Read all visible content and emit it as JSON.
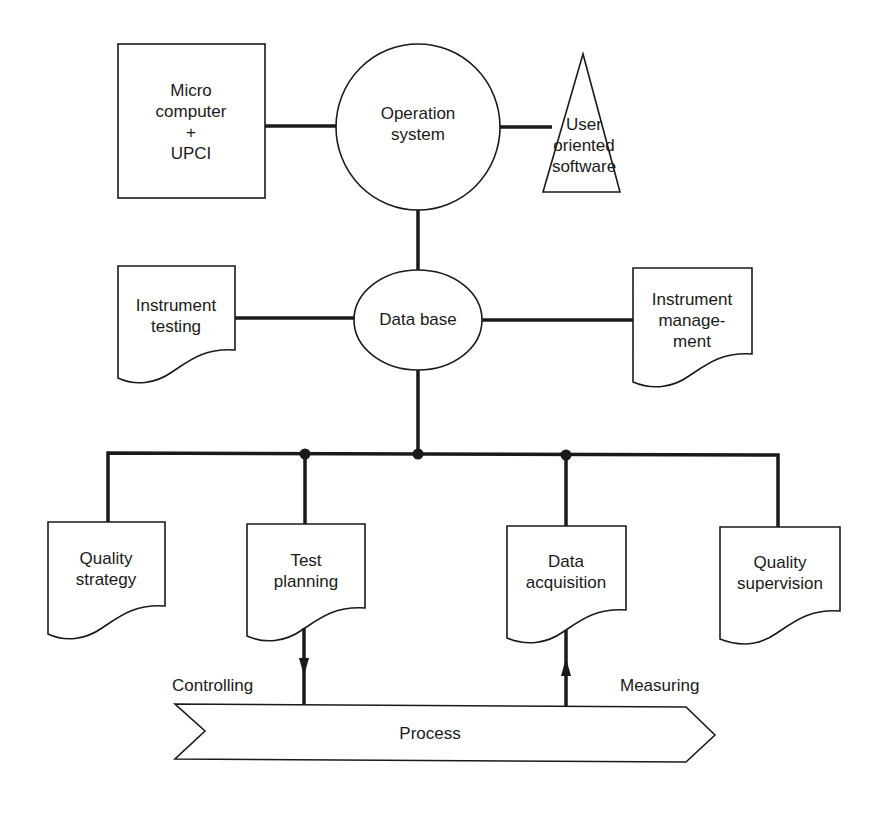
{
  "diagram": {
    "type": "block-diagram",
    "stroke_color": "#1a1a1a",
    "background": "#ffffff",
    "nodes": {
      "micro_computer": {
        "shape": "rectangle",
        "lines": [
          "Micro",
          "computer",
          "+",
          "UPCI"
        ]
      },
      "operation_system": {
        "shape": "circle",
        "lines": [
          "Operation",
          "system"
        ]
      },
      "user_software": {
        "shape": "triangle",
        "lines": [
          "User",
          "oriented",
          "software"
        ]
      },
      "instrument_testing": {
        "shape": "document",
        "lines": [
          "Instrument",
          "testing"
        ]
      },
      "data_base": {
        "shape": "ellipse",
        "lines": [
          "Data base"
        ]
      },
      "instrument_management": {
        "shape": "document",
        "lines": [
          "Instrument",
          "manage-",
          "ment"
        ]
      },
      "quality_strategy": {
        "shape": "document",
        "lines": [
          "Quality",
          "strategy"
        ]
      },
      "test_planning": {
        "shape": "document",
        "lines": [
          "Test",
          "planning"
        ]
      },
      "data_acquisition": {
        "shape": "document",
        "lines": [
          "Data",
          "acquisition"
        ]
      },
      "quality_supervision": {
        "shape": "document",
        "lines": [
          "Quality",
          "supervision"
        ]
      },
      "process": {
        "shape": "chevron-arrow",
        "lines": [
          "Process"
        ]
      }
    },
    "edge_labels": {
      "controlling": "Controlling",
      "measuring": "Measuring"
    },
    "edges": [
      {
        "from": "micro_computer",
        "to": "operation_system",
        "type": "line"
      },
      {
        "from": "operation_system",
        "to": "user_software",
        "type": "line"
      },
      {
        "from": "operation_system",
        "to": "data_base",
        "type": "line"
      },
      {
        "from": "instrument_testing",
        "to": "data_base",
        "type": "line"
      },
      {
        "from": "data_base",
        "to": "instrument_management",
        "type": "line"
      },
      {
        "from": "data_base",
        "to": "bus",
        "type": "line"
      },
      {
        "from": "bus",
        "to": "quality_strategy",
        "type": "line"
      },
      {
        "from": "bus",
        "to": "test_planning",
        "type": "line"
      },
      {
        "from": "bus",
        "to": "data_acquisition",
        "type": "line"
      },
      {
        "from": "bus",
        "to": "quality_supervision",
        "type": "line"
      },
      {
        "from": "test_planning",
        "to": "process",
        "type": "arrow",
        "label": "Controlling"
      },
      {
        "from": "process",
        "to": "data_acquisition",
        "type": "arrow",
        "label": "Measuring"
      }
    ]
  }
}
